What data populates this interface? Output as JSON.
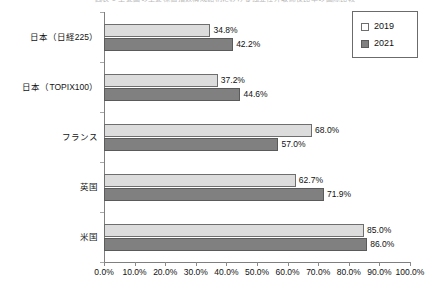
{
  "chart_data": {
    "type": "bar",
    "orientation": "horizontal",
    "title": "図表 1  主要国の主要株価指数構成銘柄における独立社外取締役比率の国際比較",
    "xlabel": "",
    "ylabel": "",
    "xlim": [
      0,
      100
    ],
    "xticks": [
      0,
      10,
      20,
      30,
      40,
      50,
      60,
      70,
      80,
      90,
      100
    ],
    "xticklabels": [
      "0.0%",
      "10.0%",
      "20.0%",
      "30.0%",
      "40.0%",
      "50.0%",
      "60.0%",
      "70.0%",
      "80.0%",
      "90.0%",
      "100.0%"
    ],
    "grid": false,
    "legend_position": "upper right",
    "categories": [
      "日本（日経225）",
      "日本（TOPIX100）",
      "フランス",
      "英国",
      "米国"
    ],
    "series": [
      {
        "name": "2019",
        "color": "#dcdcdc",
        "values": [
          34.8,
          37.2,
          68.0,
          62.7,
          85.0
        ],
        "labels": [
          "34.8%",
          "37.2%",
          "68.0%",
          "62.7%",
          "85.0%"
        ]
      },
      {
        "name": "2021",
        "color": "#808080",
        "values": [
          42.2,
          44.6,
          57.0,
          71.9,
          86.0
        ],
        "labels": [
          "42.2%",
          "44.6%",
          "57.0%",
          "71.9%",
          "86.0%"
        ]
      }
    ]
  },
  "legend": {
    "items": [
      {
        "label": "2019",
        "swatch": "legend-swatch-2019"
      },
      {
        "label": "2021",
        "swatch": "legend-swatch-2021"
      }
    ]
  }
}
